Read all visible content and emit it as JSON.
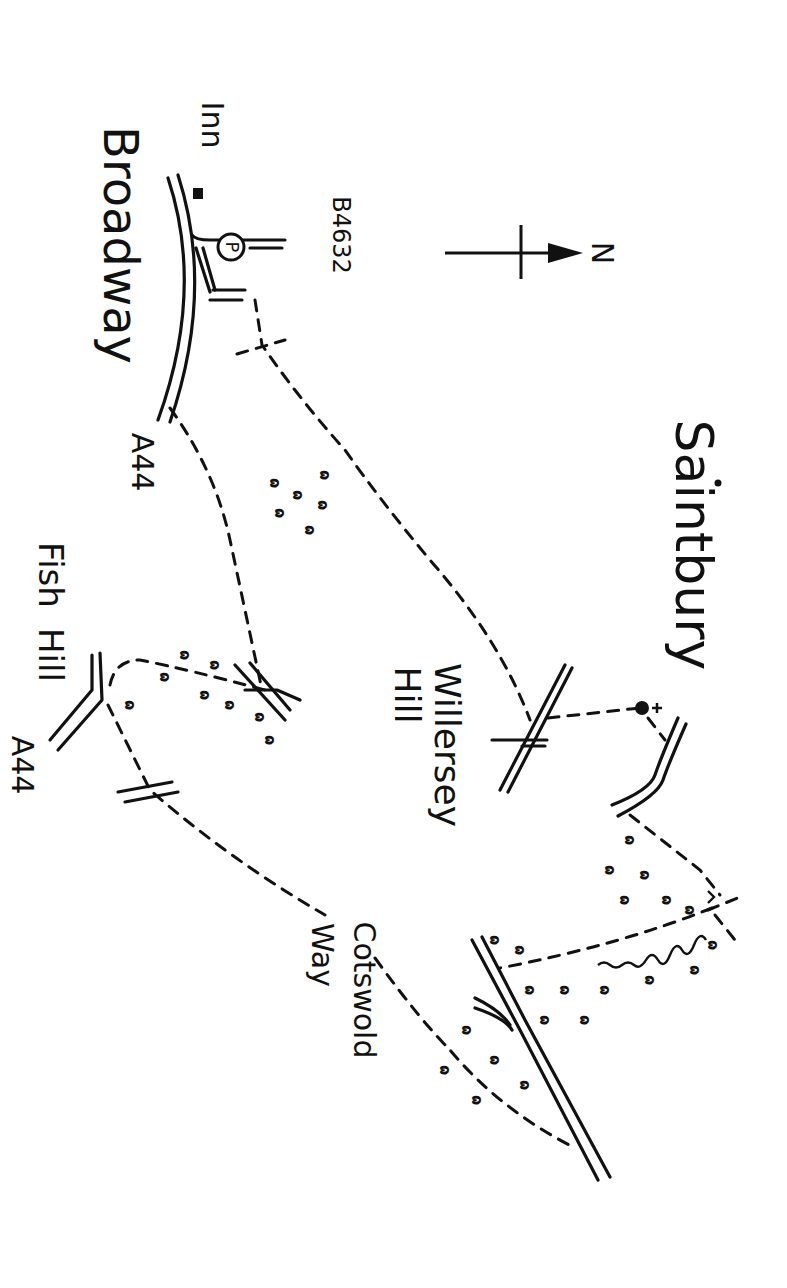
{
  "map": {
    "orientation": "rotated 90° clockwise (north points right)",
    "north_arrow": {
      "label": "N"
    },
    "places": {
      "broadway": "Broadway",
      "inn": "Inn",
      "saintbury": "Saintbury",
      "willersey_line1": "Willersey",
      "willersey_line2": "Hill",
      "fish_line1": "Fish",
      "fish_line2": "Hill",
      "cotswold_line1": "Cotswold",
      "cotswold_line2": "Way"
    },
    "roads": {
      "b4632": "B4632",
      "a44_broadway": "A44",
      "a44_fishhill": "A44"
    },
    "symbols": {
      "parking": "P",
      "church": "church-icon",
      "inn_marker": "inn-marker-icon",
      "trees": "tree-symbol"
    },
    "tree_glyph": "ɷ"
  }
}
